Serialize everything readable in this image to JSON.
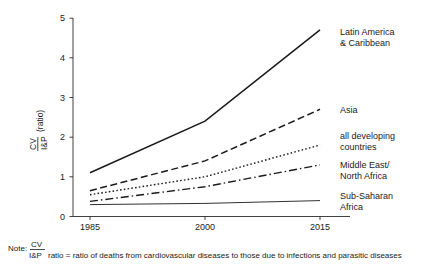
{
  "chart_data": {
    "type": "line",
    "title": "",
    "xlabel": "",
    "ylabel": "CV / I&P (ratio)",
    "ylabel_numerator": "CV",
    "ylabel_denominator": "I&P",
    "ylabel_suffix": "(ratio)",
    "x": [
      1985,
      2000,
      2015
    ],
    "categories": [
      "1985",
      "2000",
      "2015"
    ],
    "xlim": [
      1985,
      2015
    ],
    "ylim": [
      0,
      5
    ],
    "yticks": [
      0,
      1,
      2,
      3,
      4,
      5
    ],
    "ytick_labels": [
      "0",
      "1",
      "2",
      "3",
      "4",
      "5"
    ],
    "xtick_labels": [
      "1985",
      "2000",
      "2015"
    ],
    "grid": false,
    "legend_position": "right-inline-labels",
    "series": [
      {
        "name": "Latin America & Caribbean",
        "label_line1": "Latin America",
        "label_line2": "& Caribbean",
        "style": "solid",
        "values": [
          1.1,
          2.4,
          4.7
        ]
      },
      {
        "name": "Asia",
        "label_line1": "Asia",
        "label_line2": "",
        "style": "dashed",
        "values": [
          0.65,
          1.4,
          2.7
        ]
      },
      {
        "name": "all developing countries",
        "label_line1": "all developing",
        "label_line2": "countries",
        "style": "dotted",
        "values": [
          0.55,
          1.0,
          1.8
        ]
      },
      {
        "name": "Middle East/North Africa",
        "label_line1": "Middle East/",
        "label_line2": "North Africa",
        "style": "dash-dot",
        "values": [
          0.38,
          0.75,
          1.3
        ]
      },
      {
        "name": "Sub-Saharan Africa",
        "label_line1": "Sub-Saharan",
        "label_line2": "Africa",
        "style": "thin-solid",
        "values": [
          0.3,
          0.33,
          0.4
        ]
      }
    ]
  },
  "note": {
    "prefix": "Note:",
    "fraction_numerator": "CV",
    "fraction_denominator": "I&P",
    "body": "ratio = ratio of deaths from cardiovascular diseases to those due to infections and parasitic diseases"
  },
  "colors": {
    "ink": "#1a1a1a",
    "axis": "#2b2b2b",
    "background": "#ffffff"
  }
}
